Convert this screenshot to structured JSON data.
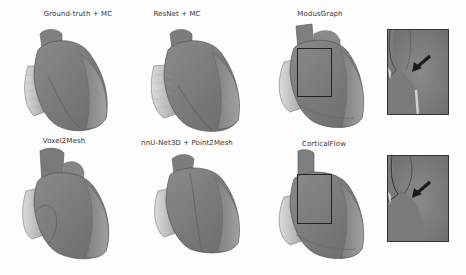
{
  "figure": {
    "caption_visible": false,
    "panels": [
      {
        "id": "gt",
        "label": "Ground-truth + MC"
      },
      {
        "id": "resnet",
        "label": "ResNet + MC"
      },
      {
        "id": "modusgraph",
        "label": "ModusGraph"
      },
      {
        "id": "voxel2mesh",
        "label": "Voxel2Mesh"
      },
      {
        "id": "nnunet",
        "label": "nnU-Net3D + Point2Mesh"
      },
      {
        "id": "corticalflow",
        "label": "CorticalFlow"
      }
    ],
    "insets": [
      {
        "for": "modusgraph",
        "annotation": "arrow pointing to defect"
      },
      {
        "for": "corticalflow",
        "annotation": "arrow pointing to defect"
      }
    ],
    "colors": {
      "heart_dark": "#6e6e6e",
      "heart_mid": "#8c8c8c",
      "heart_light": "#c4c4c4",
      "inset_bg": "#7f7f7f",
      "arrow": "#1a1a1a",
      "box": "#222222"
    }
  }
}
